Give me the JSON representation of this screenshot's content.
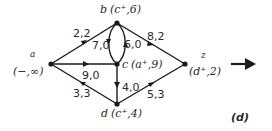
{
  "figure_label": "(d)",
  "nodes": {
    "a": {
      "name": "a",
      "label": "(−,∞)"
    },
    "b": {
      "name": "b",
      "label": "(c⁺,6)"
    },
    "c": {
      "name": "c",
      "label": "(a⁺,9)"
    },
    "d": {
      "name": "d",
      "label": "(c⁺,4)"
    },
    "z": {
      "name": "z",
      "label": "(d⁺,2)"
    }
  },
  "edges": {
    "ab": {
      "from": "a",
      "to": "b",
      "label": "2,2"
    },
    "ac": {
      "from": "a",
      "to": "c",
      "label": "9,0"
    },
    "ad": {
      "from": "a",
      "to": "d",
      "label": "3,3"
    },
    "bc": {
      "from": "b",
      "to": "c",
      "label": "7,0"
    },
    "cb": {
      "from": "c",
      "to": "b",
      "label": "6,0"
    },
    "cd": {
      "from": "c",
      "to": "d",
      "label": "4,0"
    },
    "bz": {
      "from": "b",
      "to": "z",
      "label": "8,2"
    },
    "dz": {
      "from": "d",
      "to": "z",
      "label": "5,3"
    }
  },
  "next_arrow": "right-arrow"
}
